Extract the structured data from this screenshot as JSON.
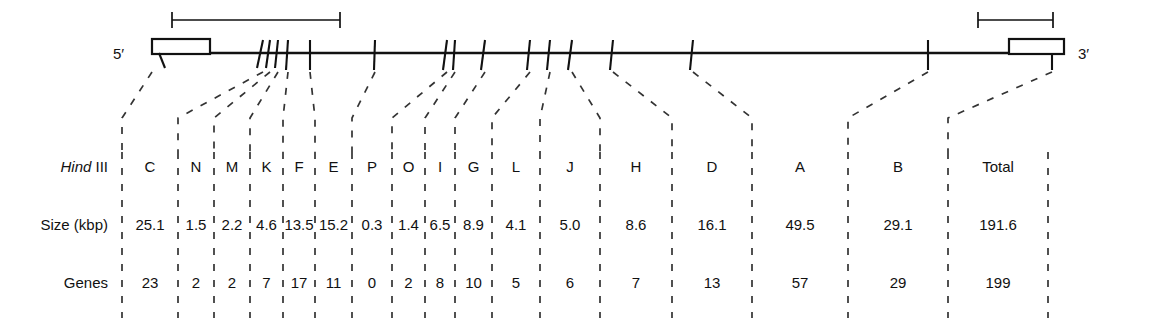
{
  "diagram": {
    "strand_labels": {
      "left": "5′",
      "right": "3′"
    },
    "colors": {
      "ink": "#111111",
      "dash": "#333333",
      "background": "#ffffff"
    },
    "map": {
      "line_start_x": 152,
      "line_end_x": 1064,
      "line_y": 53,
      "ltr_left": {
        "x": 152,
        "width": 58,
        "height": 15,
        "name": "5-prime-terminal-repeat"
      },
      "ltr_right": {
        "x": 1009,
        "width": 55,
        "height": 15,
        "name": "3-prime-terminal-repeat"
      },
      "tick_positions": [
        152,
        263,
        270,
        278,
        288,
        310,
        375,
        447,
        455,
        485,
        530,
        550,
        572,
        613,
        693,
        928,
        1052
      ],
      "scale_bars": [
        {
          "name": "left-scale-bar",
          "x1": 172,
          "x2": 340,
          "y": 20
        },
        {
          "name": "right-scale-bar",
          "x1": 978,
          "x2": 1053,
          "y": 20
        }
      ]
    },
    "column_boundaries": [
      122,
      178,
      214,
      250,
      283,
      315,
      352,
      392,
      425,
      455,
      492,
      540,
      600,
      672,
      752,
      848,
      948,
      1048
    ],
    "rows": [
      {
        "name": "hind-iii-row",
        "label_parts": {
          "italic": "Hind",
          "roman": " III"
        },
        "label": "Hind III",
        "y": 172,
        "values": [
          "C",
          "N",
          "M",
          "K",
          "F",
          "E",
          "P",
          "O",
          "I",
          "G",
          "L",
          "J",
          "H",
          "D",
          "A",
          "B",
          "Total"
        ]
      },
      {
        "name": "size-row",
        "label": "Size (kbp)",
        "y": 230,
        "values": [
          "25.1",
          "1.5",
          "2.2",
          "4.6",
          "13.5",
          "15.2",
          "0.3",
          "1.4",
          "6.5",
          "8.9",
          "4.1",
          "5.0",
          "8.6",
          "16.1",
          "49.5",
          "29.1",
          "191.6"
        ]
      },
      {
        "name": "genes-row",
        "label": "Genes",
        "y": 288,
        "values": [
          "23",
          "2",
          "2",
          "7",
          "17",
          "11",
          "0",
          "2",
          "8",
          "10",
          "5",
          "6",
          "7",
          "13",
          "57",
          "29",
          "199"
        ]
      }
    ],
    "leaders": [
      {
        "top_x": 152,
        "bottom_x": 122
      },
      {
        "top_x": 263,
        "bottom_x": 178
      },
      {
        "top_x": 270,
        "bottom_x": 214
      },
      {
        "top_x": 278,
        "bottom_x": 250
      },
      {
        "top_x": 288,
        "bottom_x": 283
      },
      {
        "top_x": 310,
        "bottom_x": 315
      },
      {
        "top_x": 375,
        "bottom_x": 352
      },
      {
        "top_x": 447,
        "bottom_x": 392
      },
      {
        "top_x": 455,
        "bottom_x": 425
      },
      {
        "top_x": 485,
        "bottom_x": 455
      },
      {
        "top_x": 530,
        "bottom_x": 492
      },
      {
        "top_x": 550,
        "bottom_x": 540
      },
      {
        "top_x": 572,
        "bottom_x": 600
      },
      {
        "top_x": 613,
        "bottom_x": 672
      },
      {
        "top_x": 693,
        "bottom_x": 752
      },
      {
        "top_x": 928,
        "bottom_x": 848
      },
      {
        "top_x": 1052,
        "bottom_x": 948
      }
    ]
  }
}
